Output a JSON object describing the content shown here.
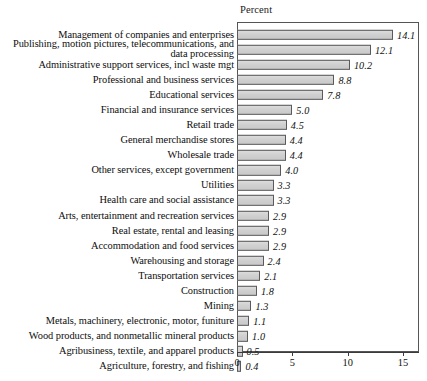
{
  "chart_data": {
    "type": "bar",
    "orientation": "horizontal",
    "title": "",
    "xlabel": "Percent",
    "ylabel": "",
    "xlim": [
      0,
      16.25
    ],
    "xticks": [
      0,
      5,
      10,
      15
    ],
    "xtick_labels": [
      "0",
      "5",
      "10",
      "15"
    ],
    "grid": false,
    "legend": null,
    "value_label_format": "one-decimal-italic",
    "categories": [
      "Management of companies and enterprises",
      "Publishing, motion pictures, telecommunications, and\ndata processing",
      "Administrative support services, incl waste mgt",
      "Professional and business services",
      "Educational services",
      "Financial and insurance services",
      "Retail trade",
      "General merchandise stores",
      "Wholesale trade",
      "Other services, except government",
      "Utilities",
      "Health care and social assistance",
      "Arts, entertainment and recreation services",
      "Real estate, rental and leasing",
      "Accommodation and food services",
      "Warehousing and storage",
      "Transportation services",
      "Construction",
      "Mining",
      "Metals, machinery, electronic, motor, funiture",
      "Wood products, and nonmetallic mineral products",
      "Agribusiness, textile, and apparel products",
      "Agriculture, forestry, and fishing"
    ],
    "values": [
      14.1,
      12.1,
      10.2,
      8.8,
      7.8,
      5.0,
      4.5,
      4.4,
      4.4,
      4.0,
      3.3,
      3.3,
      2.9,
      2.9,
      2.9,
      2.4,
      2.1,
      1.8,
      1.3,
      1.1,
      1.0,
      0.5,
      0.4
    ],
    "value_labels": [
      "14.1",
      "12.1",
      "10.2",
      "8.8",
      "7.8",
      "5.0",
      "4.5",
      "4.4",
      "4.4",
      "4.0",
      "3.3",
      "3.3",
      "2.9",
      "2.9",
      "2.9",
      "2.4",
      "2.1",
      "1.8",
      "1.3",
      "1.1",
      "1.0",
      "0.5",
      "0.4"
    ],
    "colors": {
      "bar_fill": "#d2d2d2",
      "bar_stroke": "#5a5a5a",
      "frame": "#555555",
      "text": "#111111",
      "background": "#ffffff"
    }
  }
}
